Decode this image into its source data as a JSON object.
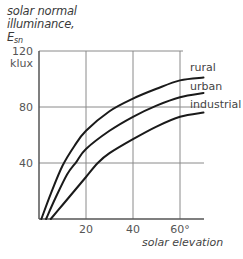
{
  "chart": {
    "ylabel_line1": "solar normal",
    "ylabel_line2": "illuminance,",
    "ylabel_symbol": "E",
    "ylabel_subscript": "sn",
    "yunit": "klux",
    "xlabel": "solar elevation",
    "yticks": [
      "40",
      "80",
      "120"
    ],
    "xticks": [
      "20",
      "40",
      "60°"
    ],
    "series_labels": [
      "rural",
      "urban",
      "industrial"
    ]
  },
  "colors": {
    "curve": "#1a1a1a",
    "grid": "#8a8a8a",
    "axis": "#555555",
    "text": "#444444"
  },
  "chart_data": {
    "type": "line",
    "title": "",
    "xlabel": "solar elevation",
    "ylabel": "solar normal illuminance, Esn (klux)",
    "xlim": [
      0,
      70
    ],
    "ylim": [
      0,
      120
    ],
    "xticks": [
      20,
      40,
      60
    ],
    "yticks": [
      40,
      80,
      120
    ],
    "grid": true,
    "legend": "inline labels at right end of curves",
    "series": [
      {
        "name": "rural",
        "x": [
          1,
          5,
          10,
          15,
          20,
          30,
          40,
          50,
          60,
          70
        ],
        "y": [
          0,
          18,
          38,
          52,
          63,
          77,
          86,
          93,
          99,
          101
        ]
      },
      {
        "name": "urban",
        "x": [
          3,
          7,
          12,
          16,
          20,
          30,
          40,
          50,
          60,
          70
        ],
        "y": [
          0,
          15,
          32,
          41,
          50,
          63,
          73,
          81,
          87,
          90
        ]
      },
      {
        "name": "industrial",
        "x": [
          5,
          10,
          15,
          20,
          25,
          30,
          40,
          50,
          60,
          70
        ],
        "y": [
          0,
          10,
          20,
          30,
          40,
          47,
          57,
          66,
          73,
          76
        ]
      }
    ]
  }
}
